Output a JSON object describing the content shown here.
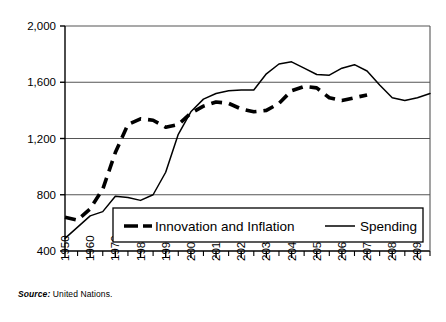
{
  "figure": {
    "source_prefix": "Source:",
    "source_text": "United Nations."
  },
  "chart_data": {
    "type": "line",
    "title": "",
    "xlabel": "",
    "ylabel": "",
    "xlim": [
      1950,
      2095
    ],
    "ylim": [
      400,
      2000
    ],
    "yticks": [
      400,
      800,
      1200,
      1600,
      2000
    ],
    "ytick_labels": [
      "400",
      "800",
      "1,200",
      "1,600",
      "2,000"
    ],
    "xticks": [
      1950,
      1960,
      1970,
      1980,
      1990,
      2000,
      2010,
      2020,
      2030,
      2040,
      2050,
      2060,
      2070,
      2080,
      2090
    ],
    "xtick_labels": [
      "1950",
      "1960",
      "1970",
      "1980",
      "1990",
      "2000",
      "2010",
      "2020",
      "2030",
      "2040",
      "2050",
      "2060",
      "2070",
      "2080",
      "2090"
    ],
    "minor_xtick_interval": 5,
    "grid": "horizontal",
    "legend_position": "bottom-center-inside",
    "line_color": "#000000",
    "series": [
      {
        "name": "Innovation and Inflation",
        "style": "dashed",
        "x": [
          1950,
          1955,
          1960,
          1965,
          1970,
          1975,
          1980,
          1985,
          1990,
          1995,
          2000,
          2005,
          2010,
          2015,
          2020,
          2025,
          2030,
          2035,
          2040,
          2045,
          2050,
          2055,
          2060,
          2065,
          2070
        ],
        "y": [
          640,
          620,
          700,
          840,
          1100,
          1300,
          1340,
          1330,
          1280,
          1300,
          1380,
          1430,
          1460,
          1450,
          1410,
          1390,
          1400,
          1450,
          1540,
          1570,
          1560,
          1490,
          1470,
          1490,
          1510
        ]
      },
      {
        "name": "Spending",
        "style": "solid",
        "x": [
          1950,
          1955,
          1960,
          1965,
          1970,
          1975,
          1980,
          1985,
          1990,
          1995,
          2000,
          2005,
          2010,
          2015,
          2020,
          2025,
          2030,
          2035,
          2040,
          2045,
          2050,
          2055,
          2060,
          2065,
          2070,
          2075,
          2080,
          2085,
          2090,
          2095
        ],
        "y": [
          490,
          570,
          650,
          680,
          790,
          780,
          760,
          800,
          960,
          1230,
          1390,
          1480,
          1520,
          1540,
          1545,
          1545,
          1660,
          1730,
          1745,
          1700,
          1655,
          1650,
          1700,
          1725,
          1680,
          1580,
          1490,
          1470,
          1490,
          1520
        ]
      }
    ],
    "legend": [
      {
        "label": "Innovation and Inflation",
        "style": "dashed"
      },
      {
        "label": "Spending",
        "style": "solid"
      }
    ]
  }
}
